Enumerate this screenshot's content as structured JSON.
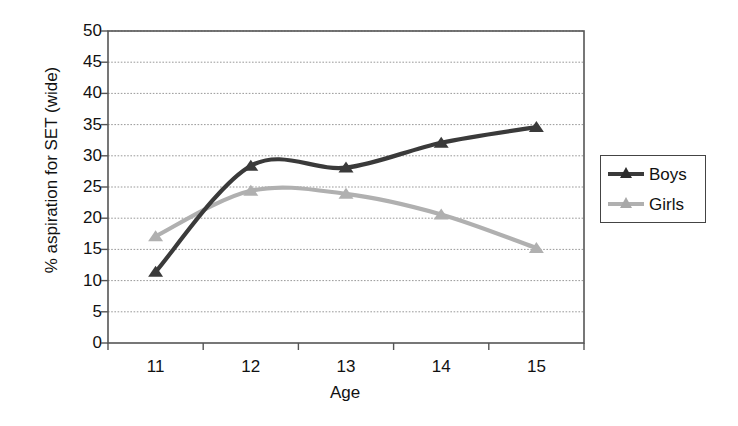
{
  "chart_data": {
    "type": "line",
    "title": "",
    "xlabel": "Age",
    "ylabel": "% aspiration for SET (wide)",
    "categories": [
      "11",
      "12",
      "13",
      "14",
      "15"
    ],
    "x": [
      11,
      12,
      13,
      14,
      15
    ],
    "xlim": [
      10.5,
      15.5
    ],
    "ylim": [
      0,
      50
    ],
    "ytick_labels": [
      "0",
      "5",
      "10",
      "15",
      "20",
      "25",
      "30",
      "35",
      "40",
      "45",
      "50"
    ],
    "yticks": [
      0,
      5,
      10,
      15,
      20,
      25,
      30,
      35,
      40,
      45,
      50
    ],
    "grid": true,
    "grid_axis": "y",
    "grid_style": "dotted",
    "legend_position": "right",
    "smoothed": true,
    "marker": "triangle",
    "series": [
      {
        "name": "Boys",
        "color": "#3a3a3a",
        "values": [
          11.4,
          28.4,
          28.1,
          32.1,
          34.6
        ]
      },
      {
        "name": "Girls",
        "color": "#b0b0b0",
        "values": [
          17.1,
          24.4,
          23.9,
          20.6,
          15.2
        ]
      }
    ]
  },
  "legend": {
    "entries": [
      {
        "label": "Boys"
      },
      {
        "label": "Girls"
      }
    ]
  },
  "axes": {
    "frame_color": "#555555",
    "gridline_color": "#999999"
  }
}
